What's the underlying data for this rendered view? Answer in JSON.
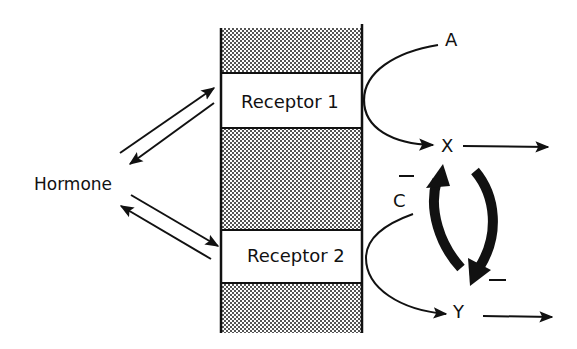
{
  "diagram": {
    "type": "hormone-receptor-signaling",
    "colors": {
      "ink": "#111111",
      "background": "#ffffff",
      "membrane_fill": "#9a9a9a"
    },
    "labels": {
      "hormone": "Hormone",
      "receptor1": "Receptor 1",
      "receptor2": "Receptor 2",
      "A": "A",
      "X": "X",
      "C": "C",
      "Y": "Y",
      "minus_c": "–",
      "minus_feedback": "–"
    },
    "nodes": [
      {
        "id": "hormone",
        "label": "Hormone"
      },
      {
        "id": "receptor1",
        "label": "Receptor 1"
      },
      {
        "id": "receptor2",
        "label": "Receptor 2"
      },
      {
        "id": "A",
        "label": "A"
      },
      {
        "id": "X",
        "label": "X"
      },
      {
        "id": "C",
        "label": "C"
      },
      {
        "id": "Y",
        "label": "Y"
      }
    ],
    "edges": [
      {
        "from": "hormone",
        "to": "receptor1",
        "type": "reversible-binding"
      },
      {
        "from": "hormone",
        "to": "receptor2",
        "type": "reversible-binding"
      },
      {
        "from": "A",
        "to": "X",
        "via": "receptor1",
        "type": "conversion"
      },
      {
        "from": "C",
        "to": "Y",
        "via": "receptor2",
        "type": "conversion"
      },
      {
        "from": "X",
        "to": "output",
        "type": "downstream"
      },
      {
        "from": "Y",
        "to": "output",
        "type": "downstream"
      },
      {
        "from": "Y",
        "to": "X",
        "type": "feedback"
      },
      {
        "from": "X",
        "to": "Y",
        "type": "feedback",
        "sign": "negative"
      },
      {
        "on": "C",
        "sign": "negative"
      }
    ]
  }
}
